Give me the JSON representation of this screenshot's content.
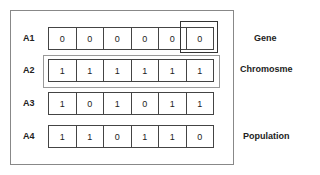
{
  "rows": [
    {
      "label": "A1",
      "values": [
        "0",
        "0",
        "0",
        "0",
        "0",
        "0"
      ]
    },
    {
      "label": "A2",
      "values": [
        "1",
        "1",
        "1",
        "1",
        "1",
        "1"
      ]
    },
    {
      "label": "A3",
      "values": [
        "1",
        "0",
        "1",
        "0",
        "1",
        "1"
      ]
    },
    {
      "label": "A4",
      "values": [
        "1",
        "1",
        "0",
        "1",
        "1",
        "0"
      ]
    }
  ],
  "labels": {
    "gene": "Gene",
    "chromosome": "Chromosme",
    "population": "Population"
  }
}
